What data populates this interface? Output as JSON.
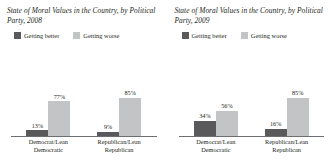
{
  "colors": {
    "better": "#59595b",
    "worse": "#c3c4c6",
    "axis": "#6d6e71",
    "text": "#231f20",
    "background": "#ffffff"
  },
  "legend": {
    "better_label": "Getting better",
    "worse_label": "Getting worse"
  },
  "panels": [
    {
      "title": "State of Moral Values in the Country, by Political Party, 2008",
      "groups": [
        {
          "label_line1": "Democrat/Lean",
          "label_line2": "Democratic",
          "better": "13%",
          "worse": "77%"
        },
        {
          "label_line1": "Republican/Lean",
          "label_line2": "Republican",
          "better": "9%",
          "worse": "85%"
        }
      ]
    },
    {
      "title": "State of Moral Values in the Country, by Political Party, 2009",
      "groups": [
        {
          "label_line1": "Democrat/Lean",
          "label_line2": "Democratic",
          "better": "34%",
          "worse": "56%"
        },
        {
          "label_line1": "Republican/Lean",
          "label_line2": "Republican",
          "better": "16%",
          "worse": "85%"
        }
      ]
    }
  ],
  "chart_data": [
    {
      "type": "bar",
      "title": "State of Moral Values in the Country, by Political Party, 2008",
      "xlabel": "",
      "ylabel": "",
      "ylim": [
        0,
        100
      ],
      "grid": false,
      "legend_position": "top-left",
      "categories": [
        "Democrat/Lean Democratic",
        "Republican/Lean Republican"
      ],
      "series": [
        {
          "name": "Getting better",
          "values": [
            13,
            9
          ],
          "color": "#59595b"
        },
        {
          "name": "Getting worse",
          "values": [
            77,
            85
          ],
          "color": "#c3c4c6"
        }
      ]
    },
    {
      "type": "bar",
      "title": "State of Moral Values in the Country, by Political Party, 2009",
      "xlabel": "",
      "ylabel": "",
      "ylim": [
        0,
        100
      ],
      "grid": false,
      "legend_position": "top-left",
      "categories": [
        "Democrat/Lean Democratic",
        "Republican/Lean Republican"
      ],
      "series": [
        {
          "name": "Getting better",
          "values": [
            34,
            16
          ],
          "color": "#59595b"
        },
        {
          "name": "Getting worse",
          "values": [
            56,
            85
          ],
          "color": "#c3c4c6"
        }
      ]
    }
  ]
}
